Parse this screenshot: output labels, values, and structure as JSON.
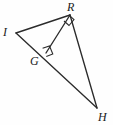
{
  "figure": {
    "background_color": "#fefefe",
    "stroke_color": "#2b2b2b",
    "label_color": "#1b1b1b",
    "canvas": {
      "width": 113,
      "height": 125
    },
    "points": [
      {
        "name": "I",
        "label": "I",
        "x": 16,
        "y": 33,
        "label_x": 3,
        "label_y": 26
      },
      {
        "name": "R",
        "label": "R",
        "x": 70,
        "y": 15,
        "label_x": 67,
        "label_y": 1
      },
      {
        "name": "G",
        "label": "G",
        "x": 46,
        "y": 53,
        "label_x": 30,
        "label_y": 55
      },
      {
        "name": "H",
        "label": "H",
        "x": 97,
        "y": 108,
        "label_x": 98,
        "label_y": 111
      }
    ],
    "segments": [
      {
        "name": "segment-IR",
        "from": "I",
        "to": "R"
      },
      {
        "name": "segment-IH",
        "from": "I",
        "to": "H"
      },
      {
        "name": "segment-RH",
        "from": "R",
        "to": "H"
      },
      {
        "name": "segment-RG",
        "from": "R",
        "to": "G"
      }
    ],
    "right_angles": [
      {
        "name": "right-angle-at-R",
        "at": "R",
        "marker": "square"
      },
      {
        "name": "right-angle-at-G",
        "at": "G",
        "marker": "square"
      }
    ]
  }
}
